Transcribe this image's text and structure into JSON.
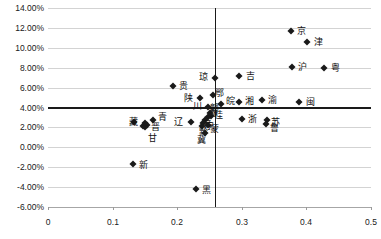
{
  "chart_data": {
    "type": "scatter",
    "title": "",
    "xlabel": "",
    "ylabel": "",
    "xlim": [
      0,
      0.5
    ],
    "ylim": [
      -0.06,
      0.14
    ],
    "grid": true,
    "legend": "none",
    "x_ticks": [
      "0",
      "0.1",
      "0.2",
      "0.3",
      "0.4",
      "0.5"
    ],
    "x_tick_values": [
      0,
      0.1,
      0.2,
      0.3,
      0.4,
      0.5
    ],
    "y_ticks": [
      "14.00%",
      "12.00%",
      "10.00%",
      "8.00%",
      "6.00%",
      "4.00%",
      "2.00%",
      "0.00%",
      "-2.00%",
      "-4.00%",
      "-6.00%"
    ],
    "y_tick_values": [
      0.14,
      0.12,
      0.1,
      0.08,
      0.06,
      0.04,
      0.02,
      0.0,
      -0.02,
      -0.04,
      -0.06
    ],
    "reference_lines": [
      {
        "name": "vertical-mean-line",
        "orientation": "vertical",
        "x": 0.258
      },
      {
        "name": "horizontal-mean-line",
        "orientation": "horizontal",
        "y": 0.041
      }
    ],
    "points": [
      {
        "label": "京",
        "x": 0.376,
        "y": 0.117,
        "label_dx": 11,
        "label_dy": 0
      },
      {
        "label": "津",
        "x": 0.401,
        "y": 0.106,
        "label_dx": 11,
        "label_dy": 0
      },
      {
        "label": "沪",
        "x": 0.377,
        "y": 0.081,
        "label_dx": 11,
        "label_dy": 0
      },
      {
        "label": "粤",
        "x": 0.428,
        "y": 0.08,
        "label_dx": 11,
        "label_dy": 0
      },
      {
        "label": "吉",
        "x": 0.296,
        "y": 0.072,
        "label_dx": 11,
        "label_dy": 0
      },
      {
        "label": "琼",
        "x": 0.258,
        "y": 0.07,
        "label_dx": -11,
        "label_dy": -1
      },
      {
        "label": "贵",
        "x": 0.193,
        "y": 0.062,
        "label_dx": 11,
        "label_dy": 0
      },
      {
        "label": "闽",
        "x": 0.389,
        "y": 0.046,
        "label_dx": 11,
        "label_dy": 0
      },
      {
        "label": "渝",
        "x": 0.331,
        "y": 0.048,
        "label_dx": 11,
        "label_dy": 0
      },
      {
        "label": "湘",
        "x": 0.296,
        "y": 0.046,
        "label_dx": 10,
        "label_dy": -1
      },
      {
        "label": "鄂",
        "x": 0.255,
        "y": 0.053,
        "label_dx": 7,
        "label_dy": -2
      },
      {
        "label": "陕",
        "x": 0.235,
        "y": 0.05,
        "label_dx": -11,
        "label_dy": 0
      },
      {
        "label": "皖",
        "x": 0.268,
        "y": 0.044,
        "label_dx": 9,
        "label_dy": -3
      },
      {
        "label": "川",
        "x": 0.248,
        "y": 0.041,
        "label_dx": -11,
        "label_dy": -1
      },
      {
        "label": "浙",
        "x": 0.3,
        "y": 0.028,
        "label_dx": 11,
        "label_dy": 0
      },
      {
        "label": "苏",
        "x": 0.339,
        "y": 0.027,
        "label_dx": 9,
        "label_dy": 2
      },
      {
        "label": "鲁",
        "x": 0.337,
        "y": 0.023,
        "label_dx": 9,
        "label_dy": 4
      },
      {
        "label": "桂",
        "x": 0.252,
        "y": 0.031,
        "label_dx": 8,
        "label_dy": -1
      },
      {
        "label": "豫",
        "x": 0.248,
        "y": 0.03,
        "label_dx": 5,
        "label_dy": -4
      },
      {
        "label": "赣",
        "x": 0.251,
        "y": 0.034,
        "label_dx": 4,
        "label_dy": -5
      },
      {
        "label": "云",
        "x": 0.243,
        "y": 0.027,
        "label_dx": 3,
        "label_dy": 4
      },
      {
        "label": "宁",
        "x": 0.24,
        "y": 0.024,
        "label_dx": 6,
        "label_dy": 3
      },
      {
        "label": "蒙",
        "x": 0.247,
        "y": 0.022,
        "label_dx": 7,
        "label_dy": 4
      },
      {
        "label": "黔",
        "x": 0.239,
        "y": 0.021,
        "label_dx": 1,
        "label_dy": 6
      },
      {
        "label": "冀",
        "x": 0.243,
        "y": 0.014,
        "label_dx": -3,
        "label_dy": 7
      },
      {
        "label": "辽",
        "x": 0.222,
        "y": 0.025,
        "label_dx": -13,
        "label_dy": 0
      },
      {
        "label": "青",
        "x": 0.163,
        "y": 0.027,
        "label_dx": 9,
        "label_dy": -3
      },
      {
        "label": "晋",
        "x": 0.153,
        "y": 0.022,
        "label_dx": 9,
        "label_dy": 2
      },
      {
        "label": "甘",
        "x": 0.15,
        "y": 0.02,
        "label_dx": 8,
        "label_dy": 11
      },
      {
        "label": "新",
        "x": 0.131,
        "y": -0.017,
        "label_dx": 11,
        "label_dy": 1
      },
      {
        "label": "黑",
        "x": 0.229,
        "y": -0.042,
        "label_dx": 11,
        "label_dy": 1
      },
      {
        "label": "藏",
        "x": 0.133,
        "y": 0.025,
        "label_dx": 0,
        "label_dy": 0
      },
      {
        "label": "",
        "x": 0.147,
        "y": 0.021,
        "label_dx": 0,
        "label_dy": 0
      },
      {
        "label": "",
        "x": 0.15,
        "y": 0.024,
        "label_dx": 0,
        "label_dy": 0
      }
    ]
  }
}
